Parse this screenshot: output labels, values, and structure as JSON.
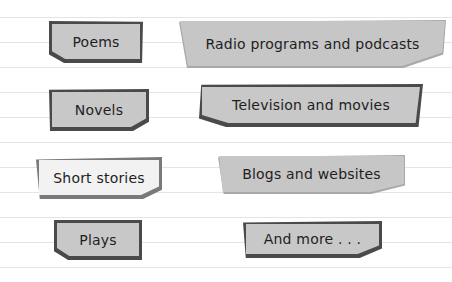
{
  "colors": {
    "background": "#ffffff",
    "rule_line": "#e4e4e4",
    "tag_fill": "#c8c8c8",
    "tag_border": "#4a4a4a",
    "highlight_fill": "#f2f2f2",
    "text": "#1e1e1e"
  },
  "left_column": [
    {
      "label": "Poems"
    },
    {
      "label": "Novels"
    },
    {
      "label": "Short stories",
      "highlighted": true
    },
    {
      "label": "Plays"
    }
  ],
  "right_column": [
    {
      "label": "Radio programs and podcasts"
    },
    {
      "label": "Television and movies"
    },
    {
      "label": "Blogs and websites"
    },
    {
      "label": "And more . . ."
    }
  ]
}
